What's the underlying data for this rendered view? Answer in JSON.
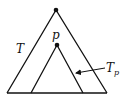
{
  "diagram": {
    "type": "tree-subtree",
    "labels": {
      "tree": "T",
      "node": "p",
      "subtree_main": "T",
      "subtree_sub": "p"
    },
    "colors": {
      "line": "#111111",
      "background": "#ffffff"
    },
    "nodes": [
      {
        "id": "root",
        "x": 56,
        "y": 10
      },
      {
        "id": "p",
        "x": 57,
        "y": 45
      }
    ],
    "outer_triangle": {
      "apex": [
        56,
        10
      ],
      "left": [
        7,
        93
      ],
      "right": [
        107,
        93
      ]
    },
    "inner_triangle": {
      "apex": [
        57,
        45
      ],
      "left": [
        31,
        93
      ],
      "right": [
        83,
        93
      ]
    },
    "arrow": {
      "from": [
        105,
        68
      ],
      "to": [
        75,
        73
      ]
    }
  }
}
